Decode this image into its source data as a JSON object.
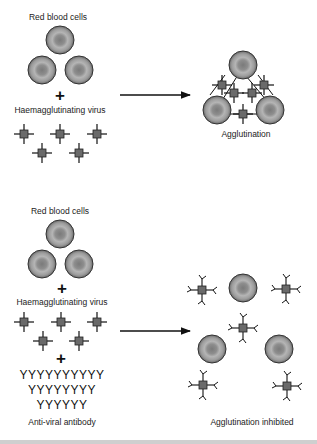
{
  "figure": {
    "top_panel": {
      "rbc_label": "Red blood cells",
      "plus": "+",
      "virus_label": "Haemagglutinating virus",
      "result_label": "Agglutination"
    },
    "bottom_panel": {
      "rbc_label": "Red blood cells",
      "plus1": "+",
      "virus_label": "Haemagglutinating virus",
      "plus2": "+",
      "antibody_rows": [
        "YYYYYYYYYY",
        "YYYYYYYY",
        "YYYYYY"
      ],
      "antibody_label": "Anti-viral antibody",
      "result_label": "Agglutination inhibited"
    },
    "icons": {
      "rbc": "red-blood-cell-icon",
      "virus": "virus-particle-icon",
      "antibody": "antibody-y-icon",
      "arrow": "right-arrow-icon"
    },
    "colors": {
      "cell_outer": "#555555",
      "cell_mid": "#9a9a9a",
      "cell_center": "#7d7d7d",
      "virus_body": "#6a6a6a",
      "line": "#111111"
    }
  }
}
